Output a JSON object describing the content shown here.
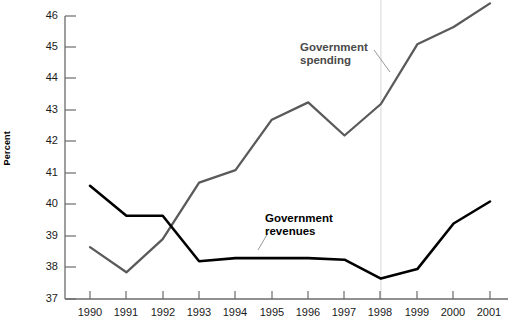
{
  "chart_data": {
    "type": "line",
    "title": "",
    "xlabel": "",
    "ylabel": "Percent",
    "x": [
      1990,
      1991,
      1992,
      1993,
      1994,
      1995,
      1996,
      1997,
      1998,
      1999,
      2000,
      2001
    ],
    "xtick_labels": [
      "1990",
      "1991",
      "1992",
      "1993",
      "1994",
      "1995",
      "1996",
      "1997",
      "1998",
      "1999",
      "2000",
      "2001"
    ],
    "ytick_labels": [
      "37",
      "38",
      "39",
      "40",
      "41",
      "42",
      "43",
      "44",
      "45",
      "46"
    ],
    "yticks": [
      37,
      38,
      39,
      40,
      41,
      42,
      43,
      44,
      45,
      46
    ],
    "ylim": [
      37,
      46.6
    ],
    "xlim": [
      1990,
      2001
    ],
    "grid": false,
    "legend_position": "inline-annotations",
    "annotations": [
      {
        "text": "Government spending",
        "series": "Government spending"
      },
      {
        "text": "Government revenues",
        "series": "Government revenues"
      }
    ],
    "vertical_reference_line": {
      "x": 1998,
      "color": "#e2e2e2"
    },
    "series": [
      {
        "name": "Government spending",
        "color": "#5a5a5a",
        "values": [
          38.65,
          37.85,
          38.9,
          40.7,
          41.1,
          42.7,
          43.25,
          42.2,
          43.2,
          45.1,
          45.65,
          46.4
        ]
      },
      {
        "name": "Government revenues",
        "color": "#000000",
        "values": [
          40.6,
          39.65,
          39.65,
          38.2,
          38.3,
          38.3,
          38.3,
          38.25,
          37.65,
          37.95,
          39.4,
          40.1
        ]
      }
    ]
  },
  "axis": {
    "y_label": "Percent",
    "y_ticks": [
      {
        "value": "46"
      },
      {
        "value": "45"
      },
      {
        "value": "44"
      },
      {
        "value": "43"
      },
      {
        "value": "42"
      },
      {
        "value": "41"
      },
      {
        "value": "40"
      },
      {
        "value": "39"
      },
      {
        "value": "38"
      },
      {
        "value": "37"
      }
    ],
    "x_ticks": [
      {
        "value": "1990"
      },
      {
        "value": "1991"
      },
      {
        "value": "1992"
      },
      {
        "value": "1993"
      },
      {
        "value": "1994"
      },
      {
        "value": "1995"
      },
      {
        "value": "1996"
      },
      {
        "value": "1997"
      },
      {
        "value": "1998"
      },
      {
        "value": "1999"
      },
      {
        "value": "2000"
      },
      {
        "value": "2001"
      }
    ]
  },
  "annotations": {
    "spending_line1": "Government",
    "spending_line2": "spending",
    "revenues_line1": "Government",
    "revenues_line2": "revenues"
  },
  "colors": {
    "spending": "#5a5a5a",
    "revenues": "#000000",
    "axis": "#555555",
    "reference_line": "#e4e4e4"
  }
}
